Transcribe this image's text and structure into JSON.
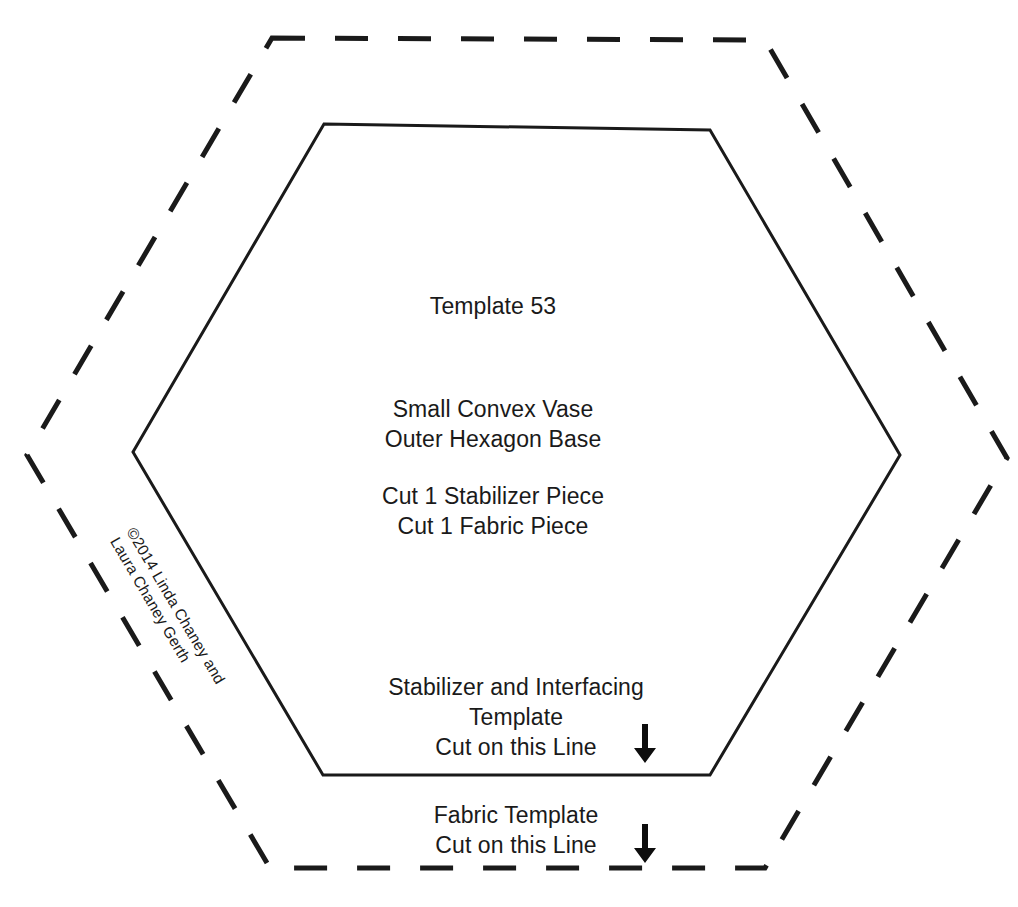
{
  "page": {
    "background_color": "#ffffff",
    "ink_color": "#1a1a1a"
  },
  "template": {
    "title": "Template 53",
    "piece_name_line1": "Small Convex Vase",
    "piece_name_line2": "Outer Hexagon Base",
    "cut_instruction_line1": "Cut 1 Stabilizer Piece",
    "cut_instruction_line2": "Cut 1 Fabric Piece",
    "copyright_line1": "©2014 Linda Chaney and",
    "copyright_line2": "Laura Chaney Gerth"
  },
  "stabilizer_guide": {
    "line1": "Stabilizer and Interfacing",
    "line2": "Template",
    "line3": "Cut on this Line",
    "arrow": "down-arrow-icon"
  },
  "fabric_guide": {
    "line1": "Fabric Template",
    "line2": "Cut on this Line",
    "arrow": "down-arrow-icon"
  },
  "shapes": {
    "inner_hexagon": {
      "style": "solid",
      "stroke_color": "#1a1a1a",
      "stroke_width": 3,
      "points": "324,124 710,130 900,455 710,775 323,775 133,452"
    },
    "outer_hexagon": {
      "style": "dashed",
      "stroke_color": "#1a1a1a",
      "stroke_width": 5,
      "dash_pattern": "33 30",
      "points": "272,38 765,40 1007,458 765,868 270,868 27,455"
    }
  }
}
